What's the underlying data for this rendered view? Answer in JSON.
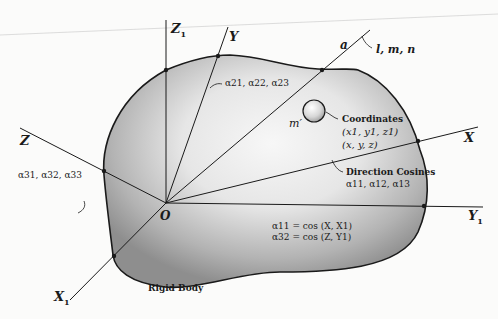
{
  "figure": {
    "body_label": "Rigid Body",
    "origin_label": "O",
    "axes": {
      "fixed": [
        {
          "id": "X1",
          "label": "X",
          "subscript": "1"
        },
        {
          "id": "Y1",
          "label": "Y",
          "subscript": "1"
        },
        {
          "id": "Z1",
          "label": "Z",
          "subscript": "1"
        }
      ],
      "body": [
        {
          "id": "X",
          "label": "X"
        },
        {
          "id": "Y",
          "label": "Y"
        },
        {
          "id": "Z",
          "label": "Z"
        }
      ],
      "arbitrary_line": {
        "label": "a",
        "cosines_label": "l, m, n"
      }
    },
    "direction_cosine_labels": {
      "row1_title": "Direction Cosines",
      "row1": "α11, α12, α13",
      "row2": "α21, α22, α23",
      "row3": "α31, α32, α33"
    },
    "particle": {
      "label": "m′",
      "coordinates_title": "Coordinates",
      "coords_fixed": "(x1, y1, z1)",
      "coords_body": "(x, y, z)"
    },
    "equations": [
      "α11 = cos (X, X1)",
      "α32 = cos (Z, Y1)"
    ],
    "colors": {
      "background": "#fbfbfa",
      "ink": "#1a1a1a",
      "body_shade_dark": "#8e8e8e",
      "body_shade_light": "#f4f4f4"
    }
  }
}
